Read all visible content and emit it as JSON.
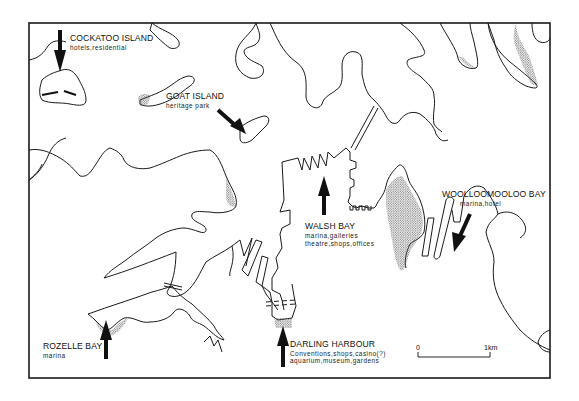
{
  "map": {
    "colors": {
      "ink": "#1a1a1a",
      "stipple": "#9a9a9a",
      "background": "#ffffff"
    },
    "locations": [
      {
        "id": "cockatoo",
        "name": "COCKATOO ISLAND",
        "uses": [
          "hotels,residential"
        ],
        "arrow": "down"
      },
      {
        "id": "goat",
        "name": "GOAT ISLAND",
        "uses": [
          "heritage park"
        ],
        "arrow": "down-right"
      },
      {
        "id": "walsh",
        "name": "WALSH BAY",
        "uses": [
          "marina,galleries",
          "theatre,shops,offices"
        ],
        "arrow": "up"
      },
      {
        "id": "woolloomooloo",
        "name": "WOOLLOOMOOLOO BAY",
        "uses": [
          "marina,hotel"
        ],
        "arrow": "down-left"
      },
      {
        "id": "rozelle",
        "name": "ROZELLE BAY",
        "uses": [
          "marina"
        ],
        "arrow": "up"
      },
      {
        "id": "darling",
        "name": "DARLING HARBOUR",
        "uses": [
          "Conventions,shops,casino(?)",
          "aquarium,museum,gardens"
        ],
        "arrow": "up"
      }
    ],
    "scale_bar": {
      "start_label": "0",
      "end_label": "1km"
    }
  }
}
